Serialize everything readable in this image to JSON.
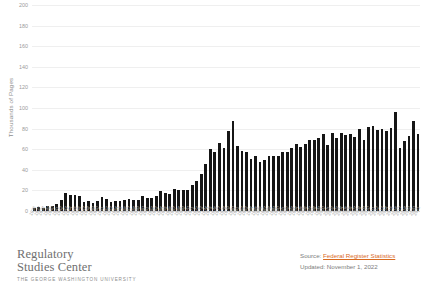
{
  "chart_data": {
    "type": "bar",
    "title": "",
    "xlabel": "",
    "ylabel": "Thousands of Pages",
    "ylim": [
      0,
      200
    ],
    "yticks": [
      200,
      180,
      160,
      140,
      120,
      100,
      80,
      60,
      40,
      20,
      0
    ],
    "ytick_labels": [
      "200",
      "180",
      "160",
      "140",
      "120",
      "100",
      "80",
      "60",
      "40",
      "20",
      "0"
    ],
    "grid": true,
    "legend": null,
    "bar_color": "#161616",
    "categories": [
      "1936",
      "1937",
      "1938",
      "1939",
      "1940",
      "1941",
      "1942",
      "1943",
      "1944",
      "1945",
      "1946",
      "1947",
      "1948",
      "1949",
      "1950",
      "1951",
      "1952",
      "1953",
      "1954",
      "1955",
      "1956",
      "1957",
      "1958",
      "1959",
      "1960",
      "1961",
      "1962",
      "1963",
      "1964",
      "1965",
      "1966",
      "1967",
      "1968",
      "1969",
      "1970",
      "1971",
      "1972",
      "1973",
      "1974",
      "1975",
      "1976",
      "1977",
      "1978",
      "1979",
      "1980",
      "1981",
      "1982",
      "1983",
      "1984",
      "1985",
      "1986",
      "1987",
      "1988",
      "1989",
      "1990",
      "1991",
      "1992",
      "1993",
      "1994",
      "1995",
      "1996",
      "1997",
      "1998",
      "1999",
      "2000",
      "2001",
      "2002",
      "2003",
      "2004",
      "2005",
      "2006",
      "2007",
      "2008",
      "2009",
      "2010",
      "2011",
      "2012",
      "2013",
      "2014",
      "2015",
      "2016",
      "2017",
      "2018",
      "2019",
      "2020",
      "2021"
    ],
    "values": [
      2.6,
      3.5,
      3.2,
      5.0,
      5.3,
      6.9,
      11.1,
      17.1,
      15.2,
      15.5,
      14.7,
      8.9,
      9.6,
      7.9,
      9.6,
      13.2,
      11.2,
      8.9,
      9.9,
      10.2,
      10.5,
      11.2,
      10.6,
      11.0,
      14.5,
      12.8,
      13.0,
      14.8,
      19.3,
      17.2,
      16.9,
      21.1,
      20.1,
      20.5,
      20.0,
      25.4,
      28.9,
      35.6,
      45.4,
      60.2,
      57.1,
      65.6,
      61.3,
      77.5,
      87.0,
      63.6,
      58.5,
      57.7,
      50.9,
      53.5,
      47.4,
      49.7,
      53.4,
      53.8,
      53.6,
      57.2,
      57.0,
      61.2,
      64.9,
      62.6,
      64.6,
      68.5,
      68.9,
      71.2,
      74.3,
      64.4,
      75.6,
      71.3,
      75.7,
      73.9,
      74.9,
      72.1,
      79.4,
      68.6,
      81.4,
      82.4,
      78.9,
      79.3,
      77.7,
      80.2,
      95.9,
      61.3,
      68.1,
      72.6,
      87.0,
      74.5
    ],
    "note": "Total pages published in the Federal Register by year"
  },
  "axis": {
    "y_title": "Thousands of Pages"
  },
  "footer": {
    "brand_line1": "Regulatory",
    "brand_line2": "Studies Center",
    "brand_subtitle": "THE GEORGE WASHINGTON UNIVERSITY",
    "source_prefix": "Source:",
    "source_link_text": "Federal Register Statistics",
    "updated_text": "Updated: November 1, 2022",
    "link_color": "#d96b1f"
  }
}
